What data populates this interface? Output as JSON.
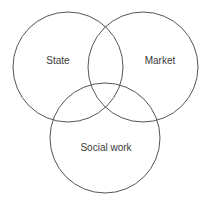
{
  "diagram": {
    "type": "venn-3-circle",
    "title": "",
    "background_color": "#ffffff",
    "stroke_color": "#555555",
    "stroke_width": 1,
    "label_color": "#3a3a3a",
    "label_font_size": 10,
    "sets": [
      {
        "id": "state",
        "label": "State",
        "cx": 68,
        "cy": 67,
        "r": 55,
        "label_x": 58,
        "label_y": 61
      },
      {
        "id": "market",
        "label": "Market",
        "cx": 143,
        "cy": 67,
        "r": 55,
        "label_x": 160,
        "label_y": 61
      },
      {
        "id": "social-work",
        "label": "Social work",
        "cx": 105,
        "cy": 138,
        "r": 55,
        "label_x": 106,
        "label_y": 148
      }
    ]
  }
}
